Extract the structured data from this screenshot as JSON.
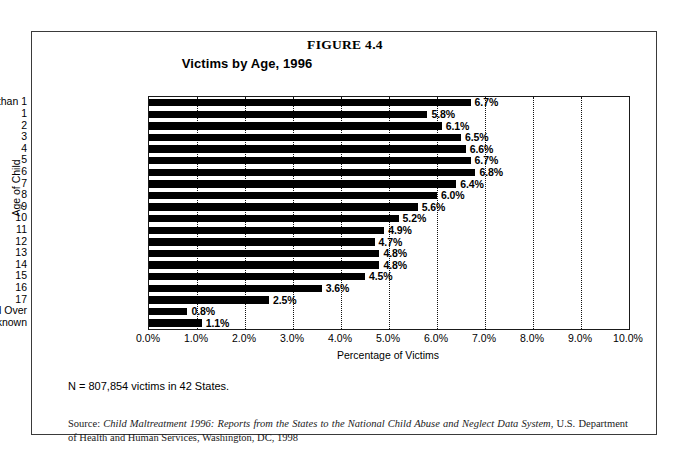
{
  "figure": {
    "number": "FIGURE 4.4",
    "subtitle": "Victims by Age, 1996",
    "n_note": "N = 807,854 victims in 42 States.",
    "source_prefix": "Source: ",
    "source_italic": "Child Maltreatment 1996: Reports from the States to the National Child Abuse and Neglect Data System",
    "source_rest": ", U.S. Department of Health and Human Services, Washington, DC, 1998"
  },
  "chart_data": {
    "type": "bar",
    "orientation": "horizontal",
    "title": "Victims by Age, 1996",
    "xlabel": "Percentage of Victims",
    "ylabel": "Age of Child",
    "xlim": [
      0,
      10
    ],
    "xticks": [
      "0.0%",
      "1.0%",
      "2.0%",
      "3.0%",
      "4.0%",
      "5.0%",
      "6.0%",
      "7.0%",
      "8.0%",
      "9.0%",
      "10.0%"
    ],
    "grid": "vertical-dotted",
    "legend": "none",
    "bar_color": "#000000",
    "categories": [
      "Less than 1",
      "1",
      "2",
      "3",
      "4",
      "5",
      "6",
      "7",
      "8",
      "9",
      "10",
      "11",
      "12",
      "13",
      "14",
      "15",
      "16",
      "17",
      "18 and Over",
      "Unknown"
    ],
    "values": [
      6.7,
      5.8,
      6.1,
      6.5,
      6.6,
      6.7,
      6.8,
      6.4,
      6.0,
      5.6,
      5.2,
      4.9,
      4.7,
      4.8,
      4.8,
      4.5,
      3.6,
      2.5,
      0.8,
      1.1
    ],
    "data_labels": [
      "6.7%",
      "5.8%",
      "6.1%",
      "6.5%",
      "6.6%",
      "6.7%",
      "6.8%",
      "6.4%",
      "6.0%",
      "5.6%",
      "5.2%",
      "4.9%",
      "4.7%",
      "4.8%",
      "4.8%",
      "4.5%",
      "3.6%",
      "2.5%",
      "0.8%",
      "1.1%"
    ]
  }
}
